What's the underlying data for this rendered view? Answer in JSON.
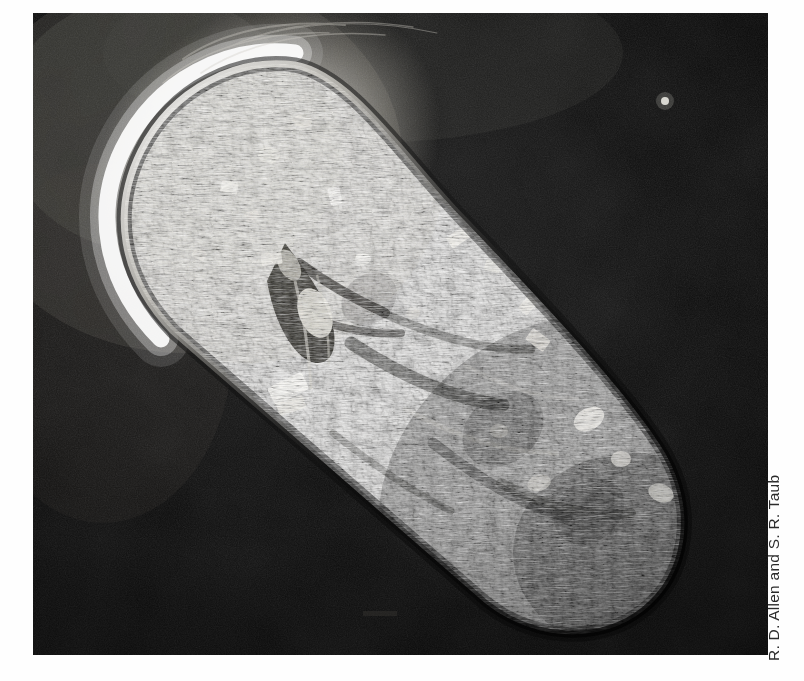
{
  "page": {
    "background_color": "#fefefe",
    "width": 804,
    "height": 681
  },
  "figure": {
    "kind": "photomicrograph",
    "technique": "differential-interference-contrast microscopy",
    "plate": {
      "x": 33,
      "y": 13,
      "width": 735,
      "height": 642,
      "background_color": "#050505",
      "description": "Elongated slipper-shaped ciliate oriented diagonally from upper-left (anterior) to lower-right (posterior) on a black field"
    },
    "features": [
      {
        "name": "anterior-halo-rim",
        "description": "Bright white refractive halo along the upper-left anterior margin",
        "color": "#f6f4ee"
      },
      {
        "name": "cilia-fringe",
        "description": "Short dark radial cilia projecting around the entire cell margin"
      },
      {
        "name": "oral-groove",
        "description": "Dark funnel-shaped oral groove / cytostome near the cell centre"
      },
      {
        "name": "cytopharynx-bands",
        "description": "Curved dark bands sweeping from centre toward the posterior"
      },
      {
        "name": "crystal-inclusions",
        "description": "Bright rectangular crystalline inclusions scattered through the cytoplasm",
        "color": "#ffffff"
      },
      {
        "name": "granular-cytoplasm",
        "description": "Dense stippled granular cytoplasm filling the cell body"
      },
      {
        "name": "debris-speck",
        "description": "Small bright speck of debris in the upper-right background"
      }
    ]
  },
  "credit": {
    "text": "R. D. Allen and S. R. Taub",
    "orientation": "vertical-rotated-90ccw",
    "color": "#2b2b2b"
  }
}
